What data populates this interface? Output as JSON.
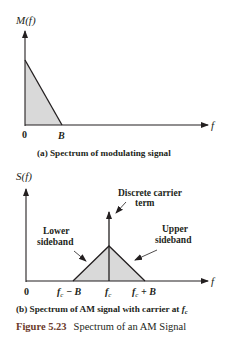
{
  "panel_a": {
    "ylabel": "M(f)",
    "xlabel": "f",
    "tick_zero": "0",
    "tick_b": "B",
    "caption": "(a) Spectrum of modulating signal"
  },
  "panel_b": {
    "ylabel": "S(f)",
    "xlabel": "f",
    "tick_zero": "0",
    "tick_fc_minus_b": "f",
    "tick_fc_minus_b_sub": "c",
    "tick_fc_minus_b_rest": " − B",
    "tick_fc": "f",
    "tick_fc_sub": "c",
    "tick_fc_plus_b": "f",
    "tick_fc_plus_b_sub": "c",
    "tick_fc_plus_b_rest": " + B",
    "carrier_label_line1": "Discrete carrier",
    "carrier_label_line2": "term",
    "lower_label_line1": "Lower",
    "lower_label_line2": "sideband",
    "upper_label_line1": "Upper",
    "upper_label_line2": "sideband",
    "caption": "(b) Spectrum of AM signal with carrier at ",
    "caption_f": "f",
    "caption_sub": "c"
  },
  "figure": {
    "number": "Figure 5.23",
    "title": "Spectrum of an AM Signal"
  },
  "colors": {
    "line": "#231f20",
    "fill": "#d9d9d9"
  }
}
